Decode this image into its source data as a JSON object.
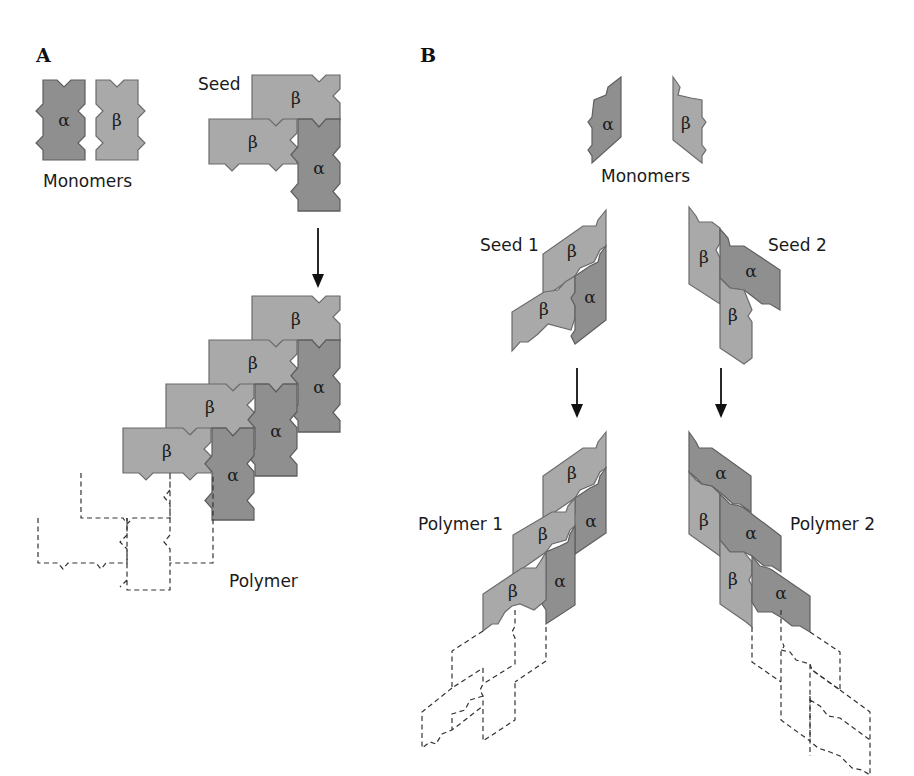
{
  "figure": {
    "panels": [
      {
        "id": "A",
        "label": "A",
        "monomers_label": "Monomers",
        "seed_label": "Seed",
        "polymer_label": "Polymer",
        "monomers": [
          {
            "type": "alpha",
            "symbol": "α"
          },
          {
            "type": "beta",
            "symbol": "β"
          }
        ],
        "seed": [
          {
            "type": "beta",
            "symbol": "β"
          },
          {
            "type": "beta",
            "symbol": "β"
          },
          {
            "type": "alpha",
            "symbol": "α"
          }
        ],
        "polymer": {
          "solid_subunits": [
            {
              "type": "beta",
              "symbol": "β"
            },
            {
              "type": "beta",
              "symbol": "β"
            },
            {
              "type": "beta",
              "symbol": "β"
            },
            {
              "type": "beta",
              "symbol": "β"
            },
            {
              "type": "alpha",
              "symbol": "α"
            },
            {
              "type": "alpha",
              "symbol": "α"
            },
            {
              "type": "alpha",
              "symbol": "α"
            }
          ],
          "dashed_subunits_count": 3
        }
      },
      {
        "id": "B",
        "label": "B",
        "monomers_label": "Monomers",
        "seeds": [
          {
            "label": "Seed 1",
            "subunits": [
              "β",
              "β",
              "α"
            ]
          },
          {
            "label": "Seed 2",
            "subunits": [
              "β",
              "α",
              "β"
            ]
          }
        ],
        "polymers": [
          {
            "label": "Polymer 1",
            "subunits": [
              "β",
              "β",
              "β",
              "α",
              "α"
            ],
            "dashed_subunits_count": 4
          },
          {
            "label": "Polymer 2",
            "subunits": [
              "α",
              "α",
              "α",
              "β",
              "β"
            ],
            "dashed_subunits_count": 4
          }
        ],
        "monomers": [
          {
            "type": "alpha",
            "symbol": "α"
          },
          {
            "type": "beta",
            "symbol": "β"
          }
        ]
      }
    ],
    "colors": {
      "alpha_fill": "#8f8f8f",
      "beta_fill": "#a9a9a9",
      "outline": "#5e5e5e",
      "ghost_outline": "#333333",
      "background": "#ffffff"
    }
  }
}
